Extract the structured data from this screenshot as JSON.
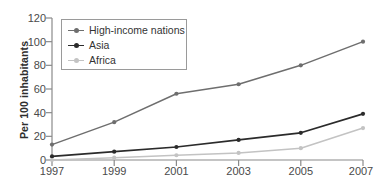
{
  "chart_data": {
    "type": "line",
    "title": "",
    "subtitle": "",
    "xlabel": "",
    "ylabel": "Per 100 inhabitants",
    "categories": [
      "1997",
      "1999",
      "2001",
      "2003",
      "2005",
      "2007"
    ],
    "x": [
      1997,
      1999,
      2001,
      2003,
      2005,
      2007
    ],
    "xlim": [
      1997,
      2007
    ],
    "ylim": [
      0,
      120
    ],
    "yticks": [
      0,
      20,
      40,
      60,
      80,
      100,
      120
    ],
    "grid": false,
    "legend_position": "top-left",
    "markers": "circle",
    "series": [
      {
        "name": "High-income nations",
        "color": "#6e6e6e",
        "values": [
          13,
          32,
          56,
          64,
          80,
          100
        ]
      },
      {
        "name": "Asia",
        "color": "#2b2b2b",
        "values": [
          3,
          7,
          11,
          17,
          23,
          39
        ]
      },
      {
        "name": "Africa",
        "color": "#c3c3c3",
        "values": [
          0,
          2,
          4,
          6,
          10,
          27
        ]
      }
    ]
  },
  "axis": {
    "y_tick_labels": [
      "0",
      "20",
      "40",
      "60",
      "80",
      "100",
      "120"
    ],
    "x_tick_labels": [
      "1997",
      "1999",
      "2001",
      "2003",
      "2005",
      "2007"
    ],
    "axis_color": "#8a8a8a"
  },
  "legend": {
    "entries": [
      {
        "label": "High-income nations",
        "color": "#6e6e6e"
      },
      {
        "label": "Asia",
        "color": "#2b2b2b"
      },
      {
        "label": "Africa",
        "color": "#c3c3c3"
      }
    ]
  }
}
